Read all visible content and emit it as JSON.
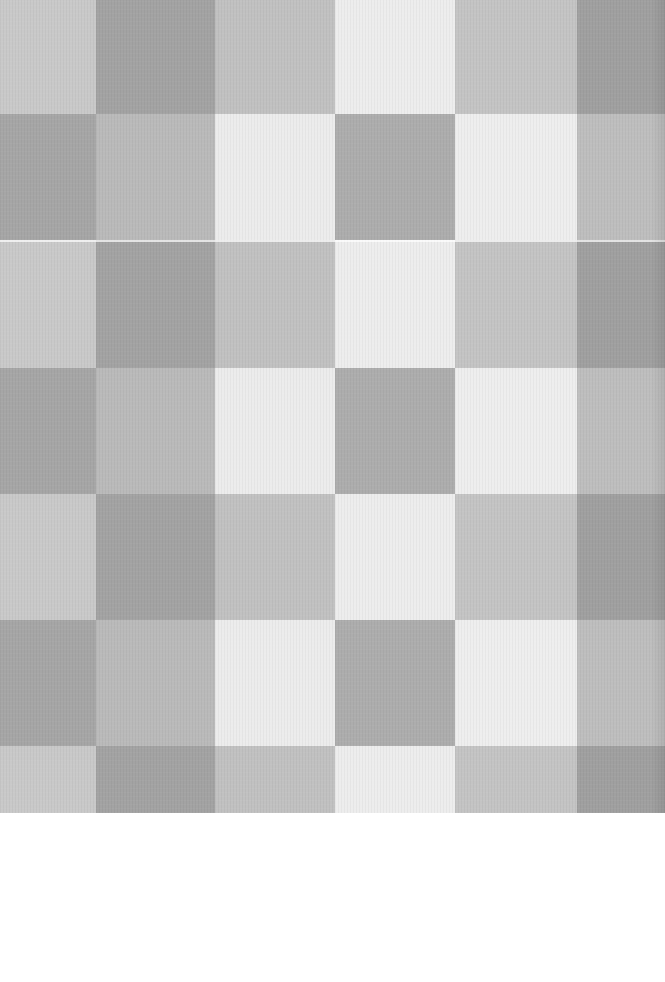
{
  "image": {
    "description": "Scanned gray gingham / checkerboard fabric pattern on white page",
    "width": 665,
    "height": 982,
    "pattern_height": 813,
    "columns_px": [
      96,
      119,
      120,
      120,
      122,
      88
    ],
    "rows_px": [
      114,
      126,
      128,
      126,
      126,
      126,
      67
    ],
    "palette": {
      "white": "#ececec",
      "light": "#c8c8c8",
      "mid": "#bdbdbd",
      "dark": "#a2a2a2",
      "page": "#ffffff"
    },
    "row_patterns": {
      "A": [
        "#c9c9c9",
        "#a3a3a3",
        "#c1c1c1",
        "#ededed",
        "#c4c4c4",
        "#a0a0a0"
      ],
      "B": [
        "#a6a6a6",
        "#bababa",
        "#ececec",
        "#adadad",
        "#eeeeee",
        "#bebebe"
      ]
    },
    "row_sequence": [
      "A",
      "B",
      "A",
      "B",
      "A",
      "B",
      "A"
    ]
  }
}
